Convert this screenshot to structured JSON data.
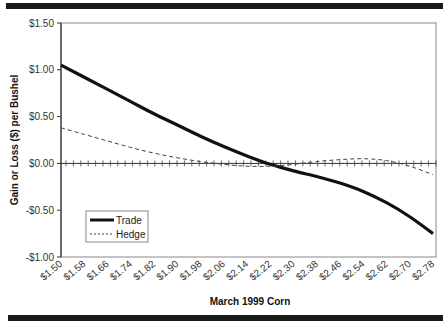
{
  "chart_data": {
    "type": "line",
    "title": "",
    "xlabel": "March 1999 Corn",
    "ylabel": "Gain or Loss ($) per Bushel",
    "categories": [
      "$1.50",
      "$1.58",
      "$1.66",
      "$1.74",
      "$1.82",
      "$1.90",
      "$1.98",
      "$2.06",
      "$2.14",
      "$2.22",
      "$2.30",
      "$2.38",
      "$2.46",
      "$2.54",
      "$2.62",
      "$2.70",
      "$2.78"
    ],
    "series": [
      {
        "name": "Trade",
        "style": "solid-thick",
        "color": "#111111",
        "values": [
          1.05,
          0.92,
          0.79,
          0.66,
          0.53,
          0.41,
          0.29,
          0.18,
          0.08,
          -0.01,
          -0.08,
          -0.14,
          -0.21,
          -0.3,
          -0.42,
          -0.57,
          -0.75
        ]
      },
      {
        "name": "Hedge",
        "style": "dashed-thin",
        "color": "#444444",
        "values": [
          0.38,
          0.31,
          0.24,
          0.17,
          0.11,
          0.06,
          0.02,
          -0.01,
          -0.03,
          -0.03,
          -0.01,
          0.02,
          0.04,
          0.05,
          0.03,
          -0.03,
          -0.12
        ]
      }
    ],
    "yticks": [
      "$1.50",
      "$1.00",
      "$0.50",
      "$0.00",
      "-$0.50",
      "-$1.00"
    ],
    "ytick_values": [
      1.5,
      1.0,
      0.5,
      0.0,
      -0.5,
      -1.0
    ],
    "ylim": [
      -1.0,
      1.5
    ],
    "grid": false,
    "zero_line": true,
    "legend_position": "lower-left inside plot"
  },
  "legend": {
    "trade_label": "Trade",
    "hedge_label": "Hedge"
  },
  "axes": {
    "xlabel": "March 1999 Corn",
    "ylabel": "Gain or Loss ($) per Bushel"
  }
}
